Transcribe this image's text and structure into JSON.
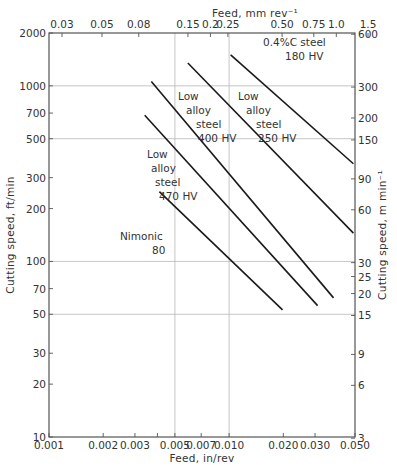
{
  "chart_data": {
    "type": "line",
    "title": "",
    "xlabel": "Feed, in/rev",
    "ylabel": "Cutting speed, ft/min",
    "x2label": "Feed, mm rev⁻¹",
    "y2label": "Cutting speed, m min⁻¹",
    "xscale": "log",
    "yscale": "log",
    "xlim": [
      0.001,
      0.05
    ],
    "ylim": [
      10,
      2000
    ],
    "x_ticks": [
      "0.001",
      "0.002",
      "0.003",
      "0.005",
      "0.007",
      "0.010",
      "0.020",
      "0.030",
      "0.050"
    ],
    "y_ticks": [
      "10",
      "20",
      "30",
      "50",
      "70",
      "100",
      "200",
      "300",
      "500",
      "700",
      "1000",
      "2000"
    ],
    "x2_ticks": [
      "0.03",
      "0.05",
      "0.08",
      "0.15",
      "0.2",
      "0.25",
      "0.50",
      "0.75",
      "1.0",
      "1.5"
    ],
    "y2_ticks": [
      "3",
      "6",
      "9",
      "15",
      "20",
      "25",
      "30",
      "60",
      "90",
      "150",
      "200",
      "300",
      "600"
    ],
    "grid": "major lines at x=0.005, 0.010; y=50, 100, 500, 1000",
    "series": [
      {
        "name": "0.4%C steel 180 HV",
        "label_lines": [
          "0.4%C steel",
          "180 HV"
        ],
        "x": [
          0.0102,
          0.049
        ],
        "y": [
          1500,
          360
        ]
      },
      {
        "name": "Low alloy steel 250 HV",
        "label_lines": [
          "Low",
          "alloy",
          "steel",
          "250 HV"
        ],
        "x": [
          0.0059,
          0.049
        ],
        "y": [
          1350,
          145
        ]
      },
      {
        "name": "Low alloy steel 400 HV",
        "label_lines": [
          "Low",
          "alloy",
          "steel",
          "400 HV"
        ],
        "x": [
          0.0037,
          0.038
        ],
        "y": [
          1060,
          62
        ]
      },
      {
        "name": "Low alloy steel 470 HV",
        "label_lines": [
          "Low",
          "alloy",
          "steel",
          "470 HV"
        ],
        "x": [
          0.0034,
          0.031
        ],
        "y": [
          680,
          56
        ]
      },
      {
        "name": "Nimonic 80",
        "label_lines": [
          "Nimonic",
          "80"
        ],
        "x": [
          0.0041,
          0.0198
        ],
        "y": [
          250,
          53
        ]
      }
    ]
  }
}
